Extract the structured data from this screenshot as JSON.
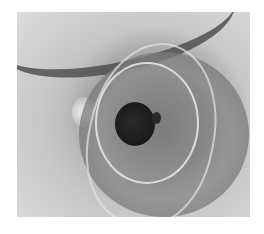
{
  "image": {
    "subject": "close-up photograph of an eye with intraocular lens implant",
    "colors": {
      "background": "#ffffff",
      "sclera": "#d4d4d4",
      "iris": "#7a7a7a",
      "pupil": "#1e1e1e"
    }
  }
}
